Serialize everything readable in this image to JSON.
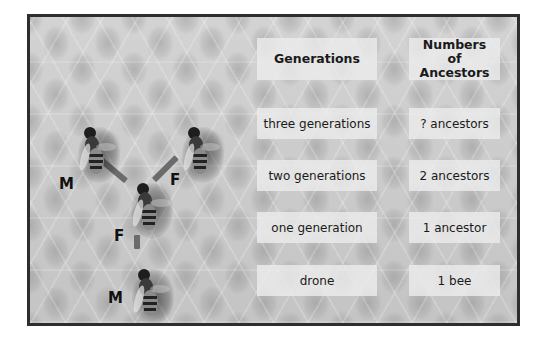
{
  "diagram": {
    "type": "bee family tree (drone ancestry)",
    "columns": {
      "generations_header": "Generations",
      "ancestors_header": "Numbers of Ancestors"
    },
    "rows": [
      {
        "generation": "three generations",
        "ancestors": "? ancestors"
      },
      {
        "generation": "two generations",
        "ancestors": "2 ancestors"
      },
      {
        "generation": "one generation",
        "ancestors": "1 ancestor"
      },
      {
        "generation": "drone",
        "ancestors": "1 bee"
      }
    ],
    "bees": [
      {
        "id": "grandfather",
        "label": "M"
      },
      {
        "id": "grandmother",
        "label": "F"
      },
      {
        "id": "mother",
        "label": "F"
      },
      {
        "id": "drone",
        "label": "M"
      }
    ],
    "colors": {
      "frame_border": "#2e2e2e",
      "background": "#c9c9c9",
      "label_box": "#ececec",
      "connector": "#6b6b6b",
      "text": "#1a1a1a"
    }
  }
}
